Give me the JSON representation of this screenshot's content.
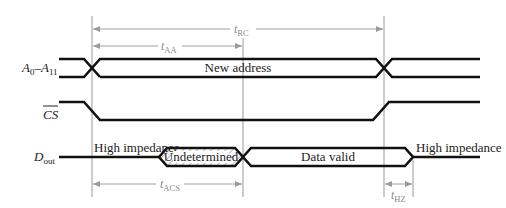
{
  "diagram": {
    "type": "timing-diagram",
    "signals": [
      {
        "name": "A",
        "sub_start": "0",
        "sep": "–",
        "name2": "A",
        "sub_end": "11",
        "state_label": "New address"
      },
      {
        "name": "CS",
        "overline": true
      },
      {
        "name": "D",
        "sub": "out",
        "states": [
          "High impedance",
          "Undetermined",
          "Data valid",
          "High impedance"
        ]
      }
    ],
    "timings": {
      "t_rc": {
        "t": "t",
        "sub": "RC"
      },
      "t_aa": {
        "t": "t",
        "sub": "AA"
      },
      "t_acs": {
        "t": "t",
        "sub": "ACS"
      },
      "t_hz": {
        "t": "t",
        "sub": "HZ"
      }
    },
    "colors": {
      "signal": "#111111",
      "guide": "#9a9a9a",
      "dimension": "#a0a0a0"
    }
  }
}
